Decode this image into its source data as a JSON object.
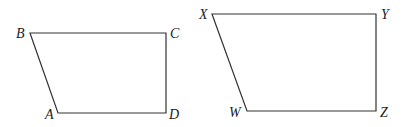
{
  "diagram": {
    "type": "two quadrilaterals",
    "figures": [
      {
        "name": "ABCD",
        "vertices": [
          {
            "label": "B",
            "x": 30,
            "y": 33
          },
          {
            "label": "C",
            "x": 166,
            "y": 33
          },
          {
            "label": "D",
            "x": 166,
            "y": 113
          },
          {
            "label": "A",
            "x": 58,
            "y": 113
          }
        ]
      },
      {
        "name": "WXYZ",
        "vertices": [
          {
            "label": "X",
            "x": 212,
            "y": 14
          },
          {
            "label": "Y",
            "x": 376,
            "y": 14
          },
          {
            "label": "Z",
            "x": 376,
            "y": 111
          },
          {
            "label": "W",
            "x": 247,
            "y": 111
          }
        ]
      }
    ],
    "labels": {
      "A": "A",
      "B": "B",
      "C": "C",
      "D": "D",
      "W": "W",
      "X": "X",
      "Y": "Y",
      "Z": "Z"
    }
  }
}
